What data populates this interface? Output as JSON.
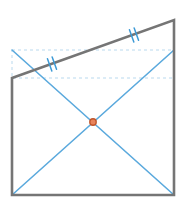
{
  "figure": {
    "width": 185,
    "height": 210,
    "background_color": "#ffffff",
    "colors": {
      "outline_gray": "#757575",
      "diagonal_blue": "#5aa9dd",
      "tick_blue": "#3d9ad6",
      "dashed_guide": "#b9d9ee",
      "center_dot_fill": "#e8845c",
      "center_dot_stroke": "#c0562c"
    },
    "shapes": {
      "quadrilateral": {
        "name": "gray-quadrilateral",
        "stroke": "#757575",
        "stroke_width": 2.6,
        "fill": "none",
        "points": "12,78 174,20 174,195 12,195",
        "vertices": [
          {
            "label": "top-left",
            "x": 12,
            "y": 78
          },
          {
            "label": "top-right",
            "x": 174,
            "y": 20
          },
          {
            "label": "bottom-right",
            "x": 174,
            "y": 195
          },
          {
            "label": "bottom-left",
            "x": 12,
            "y": 195
          }
        ]
      },
      "dashed_guide_rect": {
        "name": "dashed-guide-rectangle",
        "stroke": "#b9d9ee",
        "stroke_width": 1,
        "dash_pattern": "3 3",
        "x": 12,
        "y": 50,
        "width": 162,
        "height": 28
      },
      "diagonal_a": {
        "name": "diagonal-top-left-to-bottom-right",
        "stroke": "#5aa9dd",
        "stroke_width": 1.6,
        "x1": 12,
        "y1": 50,
        "x2": 174,
        "y2": 195
      },
      "diagonal_b": {
        "name": "diagonal-bottom-left-to-top-right",
        "stroke": "#5aa9dd",
        "stroke_width": 1.6,
        "x1": 12,
        "y1": 195,
        "x2": 174,
        "y2": 50
      },
      "center_point": {
        "name": "diagonal-intersection-point",
        "cx": 93,
        "cy": 122,
        "r": 3.2,
        "fill": "#e8845c",
        "stroke": "#c0562c",
        "stroke_width": 1.4
      }
    },
    "tick_marks": [
      {
        "name": "tick-mark-pair-left",
        "count": 2,
        "center_x": 52,
        "center_y": 64,
        "stroke": "#3d9ad6",
        "stroke_width": 1.5,
        "length": 13,
        "spacing": 5,
        "angle_deg": -19.7
      },
      {
        "name": "tick-mark-pair-right",
        "count": 2,
        "center_x": 134,
        "center_y": 35,
        "stroke": "#3d9ad6",
        "stroke_width": 1.5,
        "length": 13,
        "spacing": 5,
        "angle_deg": -19.7
      }
    ]
  }
}
